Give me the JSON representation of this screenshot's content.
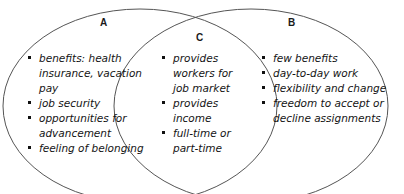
{
  "diagram": {
    "type": "venn-two-set",
    "title_visible": false,
    "background_color": "#ffffff",
    "stroke_color": "#555555",
    "text_color": "#141414",
    "bullet_glyph": "square-bullet",
    "regions": [
      {
        "id": "A",
        "label": "A",
        "position": "left",
        "items": [
          "benefits: health insurance, vacation pay",
          "job security",
          "opportunities for advancement",
          "feeling of belonging"
        ]
      },
      {
        "id": "C",
        "label": "C",
        "position": "center-overlap",
        "items": [
          "provides workers for job market",
          "provides income",
          "full-time or part-time"
        ]
      },
      {
        "id": "B",
        "label": "B",
        "position": "right",
        "items": [
          "few benefits",
          "day-to-day work",
          "flexibility and change",
          "freedom to accept or decline assignments"
        ]
      }
    ]
  }
}
